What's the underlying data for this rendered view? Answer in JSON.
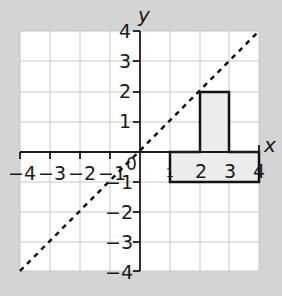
{
  "diagram": {
    "type": "coordinate-grid",
    "background": "#d4d4d4",
    "grid_color": "#c8c8c8",
    "axis_color": "#1a1a1a",
    "shape_fill": "#ececec",
    "axes": {
      "x_label": "x",
      "y_label": "y",
      "x_range": [
        -4,
        4
      ],
      "y_range": [
        -4,
        4
      ],
      "x_ticks": [
        "-4",
        "-3",
        "-2",
        "-1",
        "1",
        "2",
        "3",
        "4"
      ],
      "y_ticks": [
        "4",
        "3",
        "2",
        "1",
        "-1",
        "-2",
        "-3",
        "-4"
      ],
      "origin_label": "0"
    },
    "mirror_line": {
      "equation": "y = x",
      "style": "dashed"
    },
    "shape": {
      "name": "T-shape",
      "vertices": [
        [
          1,
          0
        ],
        [
          2,
          0
        ],
        [
          2,
          2
        ],
        [
          3,
          2
        ],
        [
          3,
          0
        ],
        [
          4,
          0
        ],
        [
          4,
          -1
        ],
        [
          1,
          -1
        ]
      ]
    }
  }
}
